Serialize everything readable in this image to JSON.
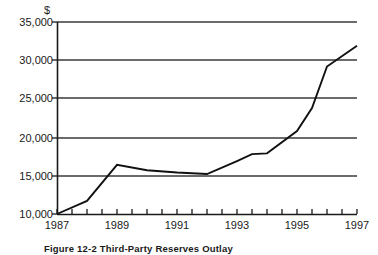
{
  "chart_data": {
    "type": "line",
    "title": "",
    "subtitle": "",
    "xlabel": "",
    "ylabel": "",
    "unit_label": "$",
    "grid": true,
    "legend": "none",
    "xlim": [
      1987,
      1997
    ],
    "ylim": [
      10000,
      35000
    ],
    "ytick_labels": [
      "35,000",
      "30,000",
      "25,000",
      "20,000",
      "15,000",
      "10,000"
    ],
    "ytick_values": [
      35000,
      30000,
      25000,
      20000,
      15000,
      10000
    ],
    "xtick_labels": [
      "1987",
      "1989",
      "1991",
      "1993",
      "1995",
      "1997"
    ],
    "xtick_values": [
      1987,
      1989,
      1991,
      1993,
      1995,
      1997
    ],
    "minor_xticks_every": 0.5,
    "series": [
      {
        "name": "value",
        "x": [
          1987,
          1988,
          1989,
          1990,
          1991,
          1992,
          1993,
          1993.5,
          1994,
          1995,
          1995.5,
          1996,
          1997
        ],
        "values": [
          10000,
          11700,
          16400,
          15700,
          15400,
          15200,
          16900,
          17800,
          17900,
          20800,
          23800,
          29200,
          31900
        ]
      }
    ]
  },
  "caption": {
    "figure_number": "Figure 12-2",
    "text": "Figure 12-2   Third-Party Reserves Outlay"
  }
}
